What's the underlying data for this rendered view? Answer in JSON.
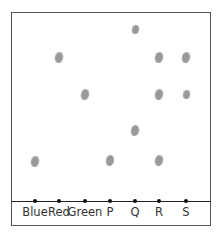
{
  "diagram": {
    "type": "paper-chromatogram",
    "colors": {
      "frame": "#555555",
      "baseline": "#222222",
      "spot": "#999999",
      "origin_dot": "#111111"
    },
    "lanes": [
      {
        "label": "Blue",
        "x": 35,
        "spots": [
          {
            "y": 161
          }
        ]
      },
      {
        "label": "Red",
        "x": 59,
        "spots": [
          {
            "y": 57
          }
        ]
      },
      {
        "label": "Green",
        "x": 85,
        "spots": [
          {
            "y": 94
          }
        ]
      },
      {
        "label": "P",
        "x": 110,
        "spots": [
          {
            "y": 160
          }
        ]
      },
      {
        "label": "Q",
        "x": 135,
        "spots": [
          {
            "y": 29,
            "small": true
          },
          {
            "y": 130
          }
        ]
      },
      {
        "label": "R",
        "x": 159,
        "spots": [
          {
            "y": 57
          },
          {
            "y": 94
          },
          {
            "y": 160
          }
        ]
      },
      {
        "label": "S",
        "x": 186,
        "spots": [
          {
            "y": 57
          },
          {
            "y": 94,
            "small": true
          }
        ]
      }
    ]
  }
}
